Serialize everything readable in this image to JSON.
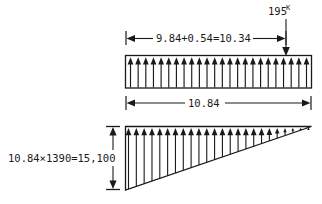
{
  "diagram": {
    "colors": {
      "line": "#1a1a1a",
      "background": "#ffffff"
    },
    "point_load": {
      "value": "195",
      "unit_superscript": "K",
      "arrow_direction": "down"
    },
    "upper": {
      "dimension_label": "9.84+0.54=10.34",
      "load_type": "uniform",
      "arrow_direction": "up",
      "arrow_count": 24,
      "span_label": "10.84"
    },
    "lower": {
      "load_type": "triangular",
      "arrow_direction": "up",
      "arrow_count": 24,
      "height_label": "10.84×1390=15,100"
    }
  }
}
